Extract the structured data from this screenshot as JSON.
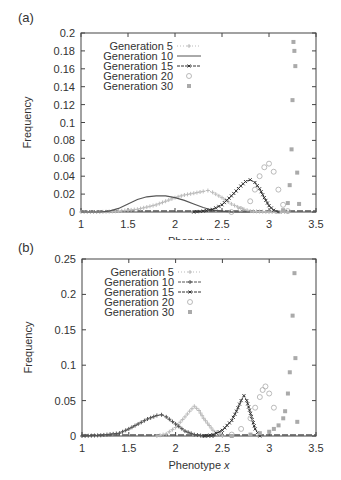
{
  "chart_data": [
    {
      "panel": "(a)",
      "type": "line",
      "title": "",
      "xlabel": "Phenotype x",
      "ylabel": "Frequency",
      "xlim": [
        1,
        3.5
      ],
      "ylim": [
        0,
        0.2
      ],
      "xticks": [
        "1",
        "1.5",
        "2",
        "2.5",
        "3",
        "3.5"
      ],
      "yticks": [
        "0",
        "0.02",
        "0.04",
        "0.06",
        "0.08",
        "0.1",
        "0.12",
        "0.14",
        "0.16",
        "0.18",
        "0.2"
      ],
      "grid": false,
      "legend_position": "top-left inside",
      "series": [
        {
          "name": "Generation 5",
          "color": "#bbbbbb",
          "marker": "+",
          "line": "dotted",
          "x": [
            1.0,
            1.2,
            1.4,
            1.6,
            1.8,
            1.9,
            2.0,
            2.1,
            2.2,
            2.3,
            2.35,
            2.4,
            2.5,
            2.6,
            2.7,
            2.8,
            3.0,
            3.2
          ],
          "y": [
            0,
            0,
            0.001,
            0.003,
            0.008,
            0.012,
            0.016,
            0.019,
            0.021,
            0.023,
            0.024,
            0.022,
            0.016,
            0.009,
            0.004,
            0.001,
            0,
            0
          ]
        },
        {
          "name": "Generation 10",
          "color": "#555555",
          "marker": "none",
          "line": "solid",
          "x": [
            1.0,
            1.2,
            1.3,
            1.4,
            1.5,
            1.6,
            1.7,
            1.8,
            1.9,
            2.0,
            2.1,
            2.2,
            2.3,
            2.4,
            2.5,
            2.6,
            2.8
          ],
          "y": [
            0,
            0,
            0.001,
            0.004,
            0.009,
            0.014,
            0.017,
            0.018,
            0.018,
            0.016,
            0.013,
            0.009,
            0.005,
            0.002,
            0.001,
            0,
            0
          ]
        },
        {
          "name": "Generation 15",
          "color": "#333333",
          "marker": "x",
          "line": "dashed",
          "x": [
            2.2,
            2.3,
            2.4,
            2.5,
            2.6,
            2.7,
            2.75,
            2.8,
            2.85,
            2.9,
            2.95,
            3.0,
            3.05,
            3.1
          ],
          "y": [
            0,
            0.001,
            0.003,
            0.008,
            0.018,
            0.029,
            0.034,
            0.036,
            0.033,
            0.026,
            0.016,
            0.007,
            0.002,
            0
          ]
        },
        {
          "name": "Generation 20",
          "color": "#aaaaaa",
          "marker": "o",
          "line": "none",
          "x": [
            2.6,
            2.7,
            2.8,
            2.85,
            2.9,
            2.95,
            3.0,
            3.05,
            3.1,
            3.15,
            3.2
          ],
          "y": [
            0,
            0.003,
            0.012,
            0.025,
            0.04,
            0.05,
            0.054,
            0.045,
            0.025,
            0.008,
            0.001
          ]
        },
        {
          "name": "Generation 30",
          "color": "#aaaaaa",
          "marker": "square",
          "line": "none",
          "x": [
            3.15,
            3.2,
            3.22,
            3.24,
            3.25,
            3.26,
            3.27,
            3.28,
            3.3,
            3.32
          ],
          "y": [
            0.002,
            0.01,
            0.03,
            0.07,
            0.125,
            0.19,
            0.18,
            0.163,
            0.044,
            0.009
          ]
        }
      ]
    },
    {
      "panel": "(b)",
      "type": "line",
      "title": "",
      "xlabel": "Phenotype x",
      "ylabel": "Frequency",
      "xlim": [
        1,
        3.5
      ],
      "ylim": [
        0,
        0.25
      ],
      "xticks": [
        "1",
        "1.5",
        "2",
        "2.5",
        "3",
        "3.5"
      ],
      "yticks": [
        "0",
        "0.05",
        "0.1",
        "0.15",
        "0.2",
        "0.25"
      ],
      "grid": false,
      "legend_position": "top-left inside",
      "series": [
        {
          "name": "Generation 5",
          "color": "#bbbbbb",
          "marker": "+",
          "line": "dotted",
          "x": [
            1.8,
            1.9,
            2.0,
            2.1,
            2.15,
            2.2,
            2.25,
            2.3,
            2.4,
            2.5
          ],
          "y": [
            0,
            0.003,
            0.012,
            0.027,
            0.035,
            0.042,
            0.036,
            0.025,
            0.008,
            0
          ]
        },
        {
          "name": "Generation 10",
          "color": "#555555",
          "marker": "+",
          "line": "dashed",
          "x": [
            1.0,
            1.2,
            1.4,
            1.5,
            1.6,
            1.7,
            1.8,
            1.85,
            1.9,
            2.0,
            2.1,
            2.2,
            2.3,
            2.4
          ],
          "y": [
            0,
            0.001,
            0.004,
            0.01,
            0.017,
            0.024,
            0.029,
            0.03,
            0.027,
            0.017,
            0.007,
            0.002,
            0,
            0
          ]
        },
        {
          "name": "Generation 15",
          "color": "#333333",
          "marker": "x",
          "line": "dashed",
          "x": [
            2.3,
            2.4,
            2.5,
            2.6,
            2.65,
            2.7,
            2.73,
            2.76,
            2.8,
            2.85,
            2.9
          ],
          "y": [
            0,
            0.002,
            0.008,
            0.022,
            0.035,
            0.05,
            0.057,
            0.05,
            0.032,
            0.01,
            0
          ]
        },
        {
          "name": "Generation 20",
          "color": "#aaaaaa",
          "marker": "o",
          "line": "none",
          "x": [
            2.6,
            2.7,
            2.8,
            2.85,
            2.9,
            2.93,
            2.96,
            3.0,
            3.05
          ],
          "y": [
            0.002,
            0.01,
            0.025,
            0.04,
            0.055,
            0.065,
            0.07,
            0.06,
            0.04
          ]
        },
        {
          "name": "Generation 30",
          "color": "#aaaaaa",
          "marker": "square",
          "line": "none",
          "x": [
            2.6,
            2.8,
            2.9,
            3.0,
            3.05,
            3.1,
            3.15,
            3.17,
            3.2,
            3.22,
            3.25,
            3.27,
            3.28,
            3.3
          ],
          "y": [
            0,
            0.002,
            0.004,
            0.006,
            0.01,
            0.015,
            0.025,
            0.035,
            0.06,
            0.09,
            0.17,
            0.23,
            0.11,
            0.02
          ]
        }
      ]
    }
  ]
}
